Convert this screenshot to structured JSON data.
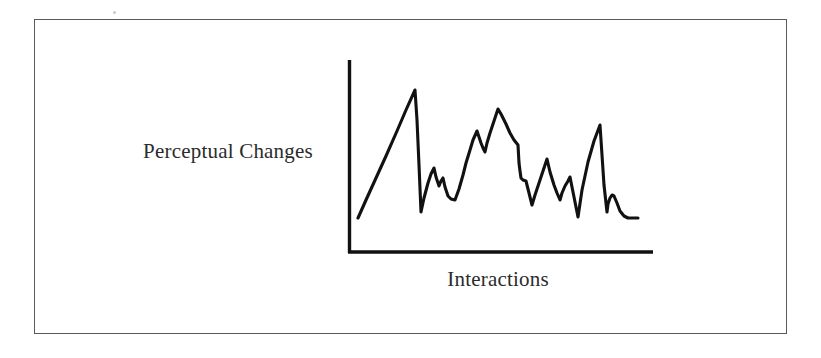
{
  "figure": {
    "border_color": "#5a5a5a",
    "background_color": "#ffffff",
    "ink_color": "#111111"
  },
  "labels": {
    "y_axis": "Perceptual Changes",
    "x_axis": "Interactions"
  },
  "chart_data": {
    "type": "line",
    "title": "",
    "subtitle": "",
    "xlabel": "Interactions",
    "ylabel": "Perceptual Changes",
    "grid": false,
    "legend": null,
    "axis_ticks": {
      "x": [],
      "y": []
    },
    "axis_ranges": {
      "xlim": [
        0,
        100
      ],
      "ylim": [
        0,
        100
      ]
    },
    "series": [
      {
        "name": "perceptual change over interactions",
        "x": [
          0,
          3,
          7,
          12,
          18,
          24,
          29,
          30,
          32,
          34,
          37,
          39,
          41,
          43,
          45,
          48,
          51,
          54,
          57,
          59,
          62,
          64,
          66,
          68,
          70,
          72,
          74,
          76,
          79,
          81,
          83,
          86,
          88,
          90,
          92,
          94,
          96,
          98,
          100
        ],
        "values": [
          24,
          31,
          40,
          51,
          62,
          72,
          84,
          85,
          22,
          25,
          37,
          45,
          40,
          34,
          36,
          28,
          30,
          45,
          58,
          67,
          62,
          71,
          79,
          83,
          75,
          68,
          60,
          46,
          40,
          28,
          34,
          48,
          38,
          26,
          22,
          63,
          18,
          27,
          23
        ]
      }
    ],
    "vertices_pixel": [
      [
        358,
        218
      ],
      [
        415,
        90
      ],
      [
        421,
        212
      ],
      [
        428,
        183
      ],
      [
        434,
        168
      ],
      [
        439,
        186
      ],
      [
        443,
        178
      ],
      [
        448,
        196
      ],
      [
        455,
        200
      ],
      [
        463,
        175
      ],
      [
        470,
        150
      ],
      [
        477,
        131
      ],
      [
        481,
        143
      ],
      [
        485,
        152
      ],
      [
        490,
        133
      ],
      [
        498,
        109
      ],
      [
        506,
        124
      ],
      [
        514,
        140
      ],
      [
        518,
        145
      ],
      [
        519,
        163
      ],
      [
        521,
        178
      ],
      [
        526,
        181
      ],
      [
        532,
        205
      ],
      [
        539,
        183
      ],
      [
        547,
        159
      ],
      [
        554,
        185
      ],
      [
        560,
        200
      ],
      [
        565,
        186
      ],
      [
        570,
        177
      ],
      [
        574,
        197
      ],
      [
        578,
        217
      ],
      [
        600,
        125
      ],
      [
        607,
        212
      ],
      [
        610,
        198
      ],
      [
        614,
        196
      ],
      [
        620,
        211
      ],
      [
        628,
        218
      ],
      [
        638,
        218
      ]
    ],
    "axes_pixel": {
      "y_axis": {
        "x": 348,
        "y_top": 60,
        "y_bottom": 253
      },
      "x_axis": {
        "y": 253,
        "x_left": 348,
        "x_right": 653
      }
    }
  }
}
